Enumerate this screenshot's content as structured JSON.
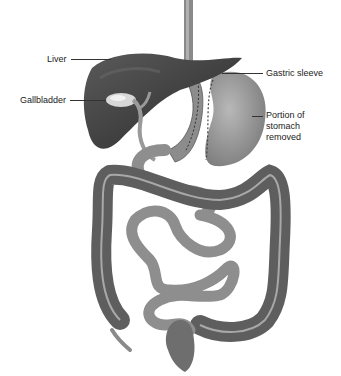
{
  "figure": {
    "labels": {
      "liver": "Liver",
      "gallbladder": "Gallbladder",
      "gastric_sleeve": "Gastric sleeve",
      "portion_removed_line1": "Portion of",
      "portion_removed_line2": "stomach",
      "portion_removed_line3": "removed"
    }
  }
}
